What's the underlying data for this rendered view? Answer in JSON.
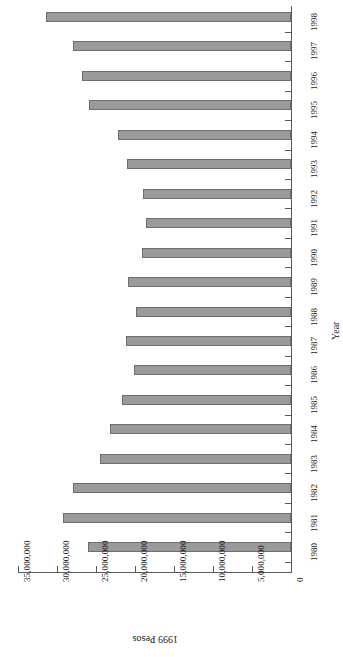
{
  "chart_data": {
    "type": "bar",
    "orientation": "horizontal",
    "title": "",
    "xlabel": "1999 Pesos",
    "ylabel": "Year",
    "categories": [
      "1998",
      "1997",
      "1996",
      "1995",
      "1994",
      "1993",
      "1992",
      "1991",
      "1990",
      "1989",
      "1988",
      "1987",
      "1986",
      "1985",
      "1984",
      "1983",
      "1982",
      "1981",
      "1980"
    ],
    "values": [
      31400000,
      28000000,
      26800000,
      25900000,
      22200000,
      21000000,
      19000000,
      18600000,
      19100000,
      20900000,
      19900000,
      21200000,
      20100000,
      21700000,
      23200000,
      24500000,
      28000000,
      29200000,
      26000000
    ],
    "value_axis_ticks": [
      35000000,
      30000000,
      25000000,
      20000000,
      15000000,
      10000000,
      5000000,
      0
    ],
    "value_axis_tick_labels": [
      "35,000,000",
      "30,000,000",
      "25,000,000",
      "20,000,000",
      "15,000,000",
      "10,000,000",
      "5,000,000",
      "0"
    ],
    "xlim": [
      0,
      35000000
    ],
    "grid": false,
    "legend": null,
    "bar_color": "#9a9a9a",
    "bar_edge_color": "#6e6e6e",
    "axis_color": "#5a5a5a",
    "rotated_180": true
  }
}
